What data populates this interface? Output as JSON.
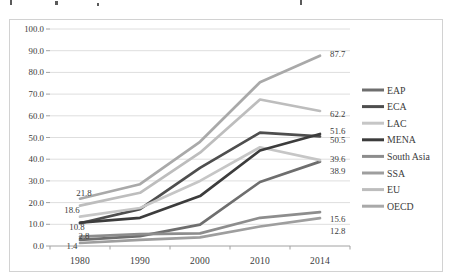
{
  "chart_data": {
    "type": "line",
    "title": "",
    "xlabel": "",
    "ylabel": "",
    "categories": [
      "1980",
      "1990",
      "2000",
      "2010",
      "2014"
    ],
    "ylim": [
      0,
      100
    ],
    "grid": true,
    "legend_position": "right",
    "y_tick_labels": [
      "100.0",
      "90.0",
      "80.0",
      "70.0",
      "60.0",
      "50.0",
      "40.0",
      "30.0",
      "20.0",
      "10.0",
      "0.0"
    ],
    "series": [
      {
        "name": "EAP",
        "color": "#6e6e6e",
        "values": [
          2.8,
          4.5,
          9.8,
          29.5,
          38.9
        ]
      },
      {
        "name": "ECA",
        "color": "#4e4e4e",
        "values": [
          10.5,
          17.0,
          36.0,
          52.2,
          50.5
        ]
      },
      {
        "name": "LAC",
        "color": "#c6c6c6",
        "values": [
          13.5,
          17.5,
          30.0,
          45.5,
          39.6
        ]
      },
      {
        "name": "MENA",
        "color": "#3c3c3c",
        "values": [
          10.8,
          13.0,
          23.0,
          44.0,
          51.6
        ]
      },
      {
        "name": "South Asia",
        "color": "#8d8d8d",
        "values": [
          4.3,
          5.5,
          5.8,
          13.0,
          15.6
        ]
      },
      {
        "name": "SSA",
        "color": "#9e9e9e",
        "values": [
          1.4,
          2.8,
          4.0,
          9.0,
          12.8
        ]
      },
      {
        "name": "EU",
        "color": "#bdbdbd",
        "values": [
          18.6,
          24.5,
          43.0,
          67.5,
          62.2
        ]
      },
      {
        "name": "OECD",
        "color": "#a9a9a9",
        "values": [
          21.8,
          28.5,
          48.0,
          75.5,
          87.7
        ]
      }
    ],
    "value_labels": {
      "left": [
        "21.8",
        "18.6",
        "10.8",
        "2.8",
        "1.4"
      ],
      "right": [
        "87.7",
        "62.2",
        "51.6",
        "50.5",
        "39.6",
        "38.9",
        "15.6",
        "12.8"
      ]
    }
  }
}
